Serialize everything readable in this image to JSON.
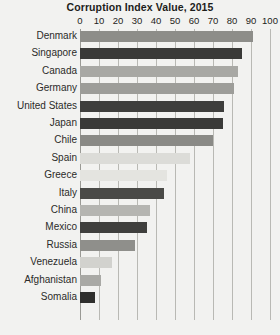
{
  "chart_data": {
    "type": "bar",
    "orientation": "horizontal",
    "title": "Corruption Index Value, 2015",
    "xlabel": "",
    "ylabel": "",
    "xlim": [
      0,
      100
    ],
    "xticks": [
      0,
      10,
      20,
      30,
      40,
      50,
      60,
      70,
      80,
      90,
      100
    ],
    "grid": true,
    "legend": false,
    "categories": [
      "Denmark",
      "Singapore",
      "Canada",
      "Germany",
      "United States",
      "Japan",
      "Chile",
      "Spain",
      "Greece",
      "Italy",
      "China",
      "Mexico",
      "Russia",
      "Venezuela",
      "Afghanistan",
      "Somalia"
    ],
    "values": [
      91,
      85,
      83,
      81,
      76,
      75,
      70,
      58,
      46,
      44,
      37,
      35,
      29,
      17,
      11,
      8
    ],
    "bar_colors": [
      "#8d8d89",
      "#3a3a38",
      "#a8a8a4",
      "#9d9d99",
      "#3e3e3c",
      "#3a3a38",
      "#8a8a86",
      "#dcdcd8",
      "#e4e4e0",
      "#4a4a47",
      "#b5b5b1",
      "#3f3f3d",
      "#8f8f8b",
      "#d2d2ce",
      "#a9a9a5",
      "#2f2f2d"
    ]
  },
  "bottom_caption": "",
  "theme": {
    "background": "#f2f2f0",
    "gridline": "#b9b9b4",
    "axis": "#9a9a95",
    "text": "#1d1d1b"
  }
}
